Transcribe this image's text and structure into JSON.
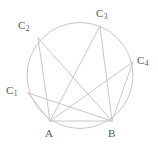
{
  "figure": {
    "background_color": "#ffffff",
    "stroke_color": "#c8c8ca",
    "label_color": "#58585a",
    "circle": {
      "cx": 80,
      "cy": 75.5,
      "r": 53
    },
    "vertices": [
      {
        "id": "A",
        "base": "A",
        "sub": "",
        "x": 50,
        "y": 121,
        "label_x": 45,
        "label_y": 128
      },
      {
        "id": "B",
        "base": "B",
        "sub": "",
        "x": 112,
        "y": 121,
        "label_x": 108,
        "label_y": 128
      },
      {
        "id": "C1",
        "base": "C",
        "sub": "1",
        "x": 28,
        "y": 93,
        "label_x": 6,
        "label_y": 85
      },
      {
        "id": "C2",
        "base": "C",
        "sub": "2",
        "x": 38,
        "y": 38,
        "label_x": 18,
        "label_y": 20
      },
      {
        "id": "C3",
        "base": "C",
        "sub": "3",
        "x": 100,
        "y": 26,
        "label_x": 96,
        "label_y": 8
      },
      {
        "id": "C4",
        "base": "C",
        "sub": "4",
        "x": 133,
        "y": 62,
        "label_x": 137,
        "label_y": 55
      }
    ],
    "chords": [
      {
        "from": "A",
        "to": "B"
      },
      {
        "from": "A",
        "to": "C1"
      },
      {
        "from": "A",
        "to": "C2"
      },
      {
        "from": "A",
        "to": "C3"
      },
      {
        "from": "A",
        "to": "C4"
      },
      {
        "from": "B",
        "to": "C1"
      },
      {
        "from": "B",
        "to": "C2"
      },
      {
        "from": "B",
        "to": "C3"
      },
      {
        "from": "B",
        "to": "C4"
      }
    ]
  }
}
